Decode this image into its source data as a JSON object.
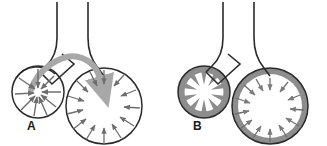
{
  "figure": {
    "name": "alveolar-surface-tension-diagram",
    "background_color": "#ffffff",
    "width": 327,
    "height": 146
  },
  "colors": {
    "outline": "#2b2b2b",
    "flow_arrow": "#a8a8a8",
    "surfactant_layer": "#8d8d8d",
    "tension_arrow": "#6e6e6e",
    "interior": "#ffffff",
    "label_text": "#1a1a1a"
  },
  "panels": [
    {
      "id": "A",
      "label": "A",
      "condition": "without-surfactant",
      "airway": {
        "name": "bronchiole-airway",
        "branches": 2
      },
      "small_alveolus": {
        "name": "small-alveolus-collapsing",
        "center_x": 38,
        "center_y": 92,
        "radius": 26,
        "wall": "thin",
        "tension_arrows": 9,
        "arrow_direction": "inward-converging"
      },
      "large_alveolus": {
        "name": "large-alveolus-expanding",
        "center_x": 104,
        "center_y": 106,
        "radius": 38,
        "wall": "thin",
        "tension_arrows": 13,
        "arrow_direction": "inward"
      },
      "flow_arrow": {
        "name": "air-flow-arrow",
        "from": "small-alveolus",
        "to": "large-alveolus",
        "style": "thick-curved-gray"
      }
    },
    {
      "id": "B",
      "label": "B",
      "condition": "with-surfactant",
      "airway": {
        "name": "bronchiole-airway",
        "branches": 2
      },
      "small_alveolus": {
        "name": "small-alveolus-stable",
        "center_x": 204,
        "center_y": 92,
        "radius": 26,
        "wall": "thick-surfactant",
        "interior_pattern": "star-scalloped",
        "spokes": 10,
        "tension_arrows": 0
      },
      "large_alveolus": {
        "name": "large-alveolus-stable",
        "center_x": 270,
        "center_y": 106,
        "radius": 38,
        "wall": "thick-surfactant",
        "tension_arrows": 13,
        "arrow_direction": "inward"
      },
      "flow_arrow": null
    }
  ]
}
